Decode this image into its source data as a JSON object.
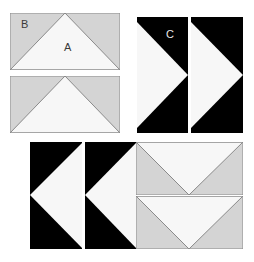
{
  "figure": {
    "title": "",
    "background_color": "#ffffff",
    "palette": {
      "gray_fill": "#d4d4d4",
      "white_fill": "#f7f7f7",
      "black_fill": "#000000",
      "outline": "#8a8a8a",
      "label_dark": "#3a3a3a",
      "label_light": "#e8e8e8"
    },
    "labels": [
      {
        "text": "B",
        "id": "label-b",
        "tone": "dark",
        "x": 21,
        "y": 19
      },
      {
        "text": "A",
        "id": "label-a",
        "tone": "dark",
        "x": 64,
        "y": 42
      },
      {
        "text": "C",
        "id": "label-c",
        "tone": "light",
        "x": 166,
        "y": 29
      }
    ],
    "groups": [
      {
        "id": "group-top-left",
        "name": "gray-peak-rectangles",
        "tiles": [
          {
            "id": "tile-gray-peak-1",
            "shape": "gray-rect-with-white-up-triangle",
            "x": 10,
            "y": 13,
            "w": 110,
            "h": 57,
            "base": "#d4d4d4",
            "triangle_fill": "#f7f7f7",
            "triangle_points": "0,57 55,0 110,57",
            "outline": "#8a8a8a"
          },
          {
            "id": "tile-gray-peak-2",
            "shape": "gray-rect-with-white-up-triangle",
            "x": 10,
            "y": 76,
            "w": 110,
            "h": 57,
            "base": "#d4d4d4",
            "triangle_fill": "#f7f7f7",
            "triangle_points": "0,57 55,0 110,57",
            "outline": "#8a8a8a"
          }
        ]
      },
      {
        "id": "group-top-right",
        "name": "black-right-arrow-squares",
        "tiles": [
          {
            "id": "tile-black-right-1",
            "shape": "black-square-with-white-right-triangle",
            "x": 137,
            "y": 17,
            "w": 51,
            "h": 116,
            "base": "#000000",
            "triangle_fill": "#f7f7f7",
            "triangle_points": "0,5 51,58 0,111",
            "outline": "none"
          },
          {
            "id": "tile-black-right-2",
            "shape": "black-square-with-white-right-triangle",
            "x": 191,
            "y": 17,
            "w": 52,
            "h": 116,
            "base": "#000000",
            "triangle_fill": "#f7f7f7",
            "triangle_points": "0,5 52,58 0,111",
            "outline": "none"
          }
        ]
      },
      {
        "id": "group-bottom-left",
        "name": "black-left-arrow-squares",
        "tiles": [
          {
            "id": "tile-black-left-1",
            "shape": "black-square-with-white-left-triangle",
            "x": 30,
            "y": 142,
            "w": 52,
            "h": 107,
            "base": "#000000",
            "triangle_fill": "#f7f7f7",
            "triangle_points": "52,1 52,106 0,53",
            "outline": "none"
          },
          {
            "id": "tile-black-left-2",
            "shape": "black-square-with-white-left-triangle",
            "x": 85,
            "y": 142,
            "w": 51,
            "h": 107,
            "base": "#000000",
            "triangle_fill": "#f7f7f7",
            "triangle_points": "51,1 51,106 0,53",
            "outline": "none"
          }
        ]
      },
      {
        "id": "group-bottom-right",
        "name": "gray-valley-rectangles",
        "tiles": [
          {
            "id": "tile-gray-valley-1",
            "shape": "gray-rect-with-white-down-triangle",
            "x": 136,
            "y": 142,
            "w": 107,
            "h": 53,
            "base": "#d4d4d4",
            "triangle_fill": "#f7f7f7",
            "triangle_points": "0,0 107,0 53,53",
            "outline": "#8a8a8a"
          },
          {
            "id": "tile-gray-valley-2",
            "shape": "gray-rect-with-white-down-triangle",
            "x": 136,
            "y": 196,
            "w": 107,
            "h": 53,
            "base": "#d4d4d4",
            "triangle_fill": "#f7f7f7",
            "triangle_points": "0,0 107,0 53,53",
            "outline": "#8a8a8a"
          }
        ]
      }
    ]
  }
}
